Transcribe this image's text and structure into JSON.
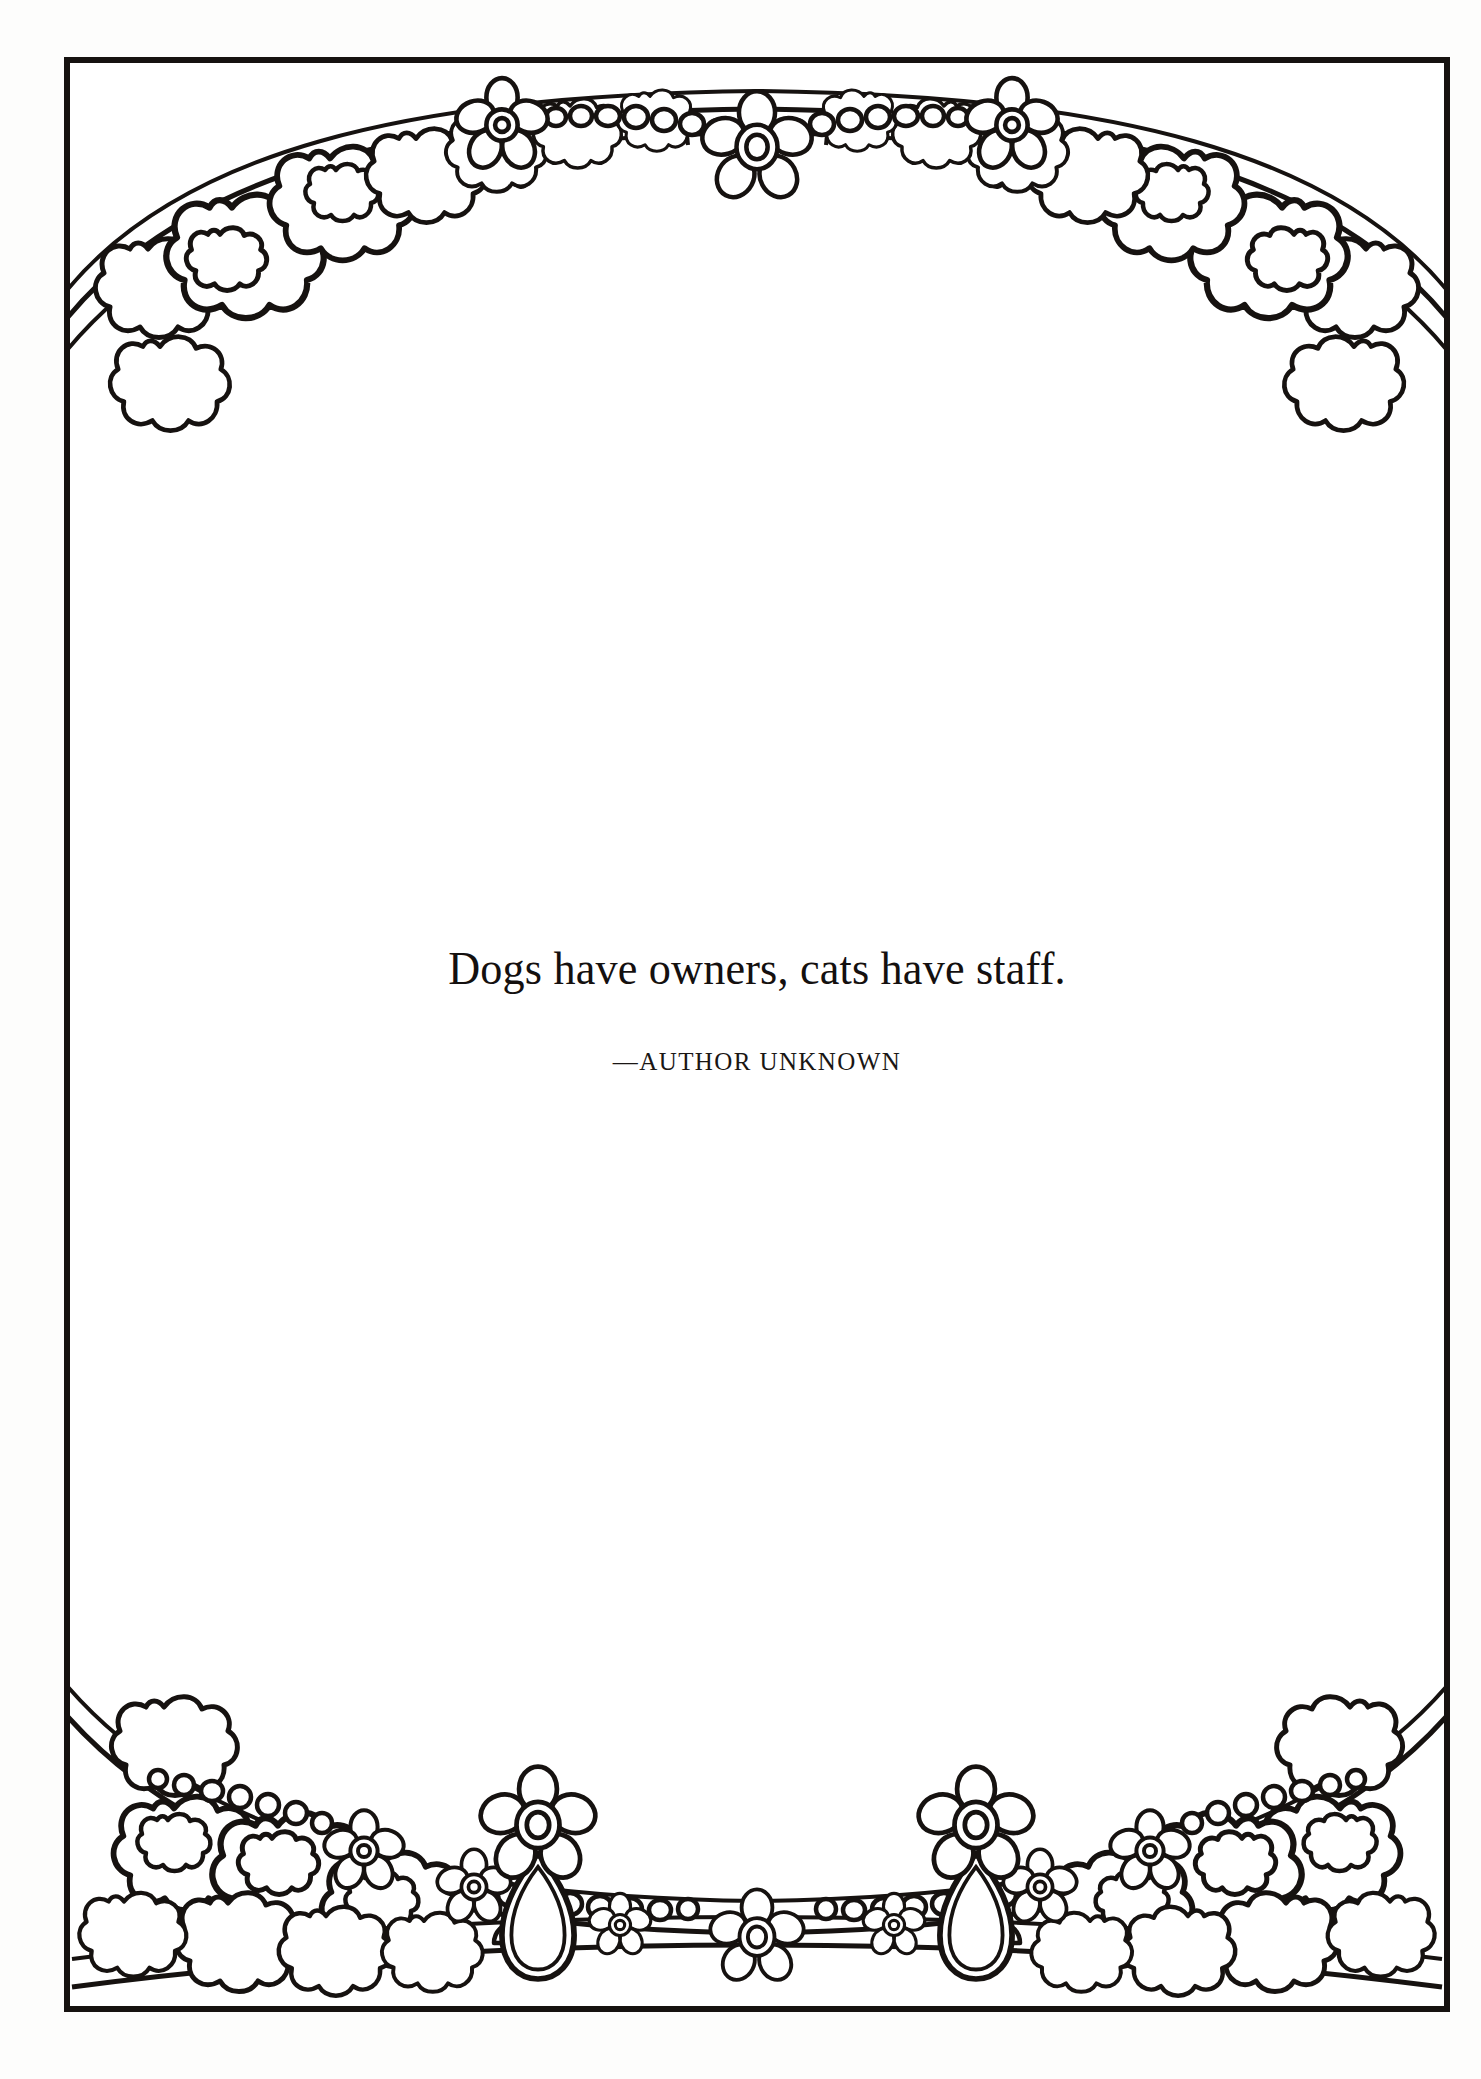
{
  "page": {
    "background_color": "#fdfdfc",
    "plate_background_color": "#ffffff",
    "ink_color": "#161210"
  },
  "frame": {
    "name": "floral-decorative-border",
    "style": "line-art coloring-book floral garland frame",
    "border_color": "#161210",
    "border_width_px": 4,
    "motifs": [
      "flower-cluster",
      "beaded-chain",
      "five-petal-flower",
      "teardrop-pendant",
      "ribbon-arc"
    ],
    "top_band_label": "top floral garland with beaded chain",
    "bottom_band_label": "bottom floral garland with pendant flowers"
  },
  "quote": {
    "text": "Dogs have owners, cats have staff.",
    "attribution": "—AUTHOR UNKNOWN"
  }
}
